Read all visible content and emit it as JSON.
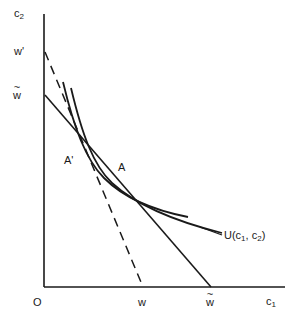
{
  "figure": {
    "type": "diagram",
    "background_color": "#ffffff",
    "line_color": "#1a1a1a",
    "width": 294,
    "height": 320
  },
  "axes": {
    "y_axis_label": "c",
    "y_axis_label_sub": "2",
    "x_axis_label": "c",
    "x_axis_label_sub": "1",
    "origin_label": "O",
    "y_ticks": [
      {
        "label": "w",
        "prime": "'",
        "kind": "prime"
      },
      {
        "label": "w",
        "kind": "tilde"
      }
    ],
    "x_ticks": [
      {
        "label": "w",
        "kind": "plain"
      },
      {
        "label": "w",
        "kind": "tilde"
      }
    ]
  },
  "labels": {
    "c2": "c",
    "c2_sub": "2",
    "c1": "c",
    "c1_sub": "1",
    "origin": "O",
    "w_prime": "w'",
    "w_tilde_y": "w",
    "w_x": "w",
    "w_tilde_x": "w",
    "point_a_prime": "A'",
    "point_a": "A",
    "utility_prefix": "U(c",
    "utility_sub1": "1",
    "utility_mid": ", c",
    "utility_sub2": "2",
    "utility_suffix": ")"
  },
  "curves": {
    "budget_line_dashed": {
      "name": "budget-line-w-prime",
      "style": "dashed",
      "from_label": "w'",
      "to_label": "w"
    },
    "budget_line_solid": {
      "name": "budget-line-w-tilde",
      "style": "solid",
      "from_label": "w-tilde",
      "to_label": "w-tilde"
    },
    "indifference_curve_1": {
      "name": "indifference-curve-upper",
      "style": "solid",
      "tangent_point": "A'"
    },
    "indifference_curve_2": {
      "name": "indifference-curve-lower",
      "style": "solid",
      "tangent_point": "A"
    }
  }
}
